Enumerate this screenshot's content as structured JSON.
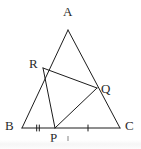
{
  "figure": {
    "kind": "geometry-diagram",
    "shape": "triangle",
    "background_color": "#ffffff",
    "stroke_color": "#1c1c1c",
    "label_color": "#2a2a2a",
    "width": 141,
    "height": 149,
    "vertices": [
      {
        "id": "A",
        "label": "A",
        "x": 68,
        "y": 30,
        "label_x": 63,
        "label_y": 5
      },
      {
        "id": "B",
        "label": "B",
        "x": 22,
        "y": 128,
        "label_x": 5,
        "label_y": 119
      },
      {
        "id": "C",
        "label": "C",
        "x": 120,
        "y": 128,
        "label_x": 125,
        "label_y": 119
      }
    ],
    "points": [
      {
        "id": "R",
        "label": "R",
        "on_segment": "AB",
        "x": 43,
        "y": 68,
        "label_x": 29,
        "label_y": 57
      },
      {
        "id": "Q",
        "label": "Q",
        "on_segment": "AC",
        "x": 97,
        "y": 88,
        "label_x": 101,
        "label_y": 82
      },
      {
        "id": "P",
        "label": "P",
        "on_segment": "BC",
        "x": 55,
        "y": 128,
        "label_x": 50,
        "label_y": 131
      }
    ],
    "sides": [
      {
        "id": "AB",
        "from": "A",
        "to": "B",
        "x1": 68,
        "y1": 30,
        "x2": 22,
        "y2": 128
      },
      {
        "id": "AC",
        "from": "A",
        "to": "C",
        "x1": 68,
        "y1": 30,
        "x2": 120,
        "y2": 128
      },
      {
        "id": "BC",
        "from": "B",
        "to": "C",
        "x1": 22,
        "y1": 128,
        "x2": 120,
        "y2": 128
      }
    ],
    "cevians": [
      {
        "id": "RQ",
        "from": "R",
        "to": "Q",
        "x1": 43,
        "y1": 68,
        "x2": 97,
        "y2": 88
      },
      {
        "id": "RP",
        "from": "R",
        "to": "P",
        "x1": 43,
        "y1": 68,
        "x2": 55,
        "y2": 128
      },
      {
        "id": "PQ",
        "from": "P",
        "to": "Q",
        "x1": 55,
        "y1": 128,
        "x2": 97,
        "y2": 88
      }
    ],
    "tick_marks": [
      {
        "id": "tick-BP",
        "segment": "BP",
        "count": 2,
        "x": 38,
        "y": 128
      },
      {
        "id": "tick-PC",
        "segment": "PC",
        "count": 1,
        "x": 88,
        "y": 128
      }
    ]
  }
}
